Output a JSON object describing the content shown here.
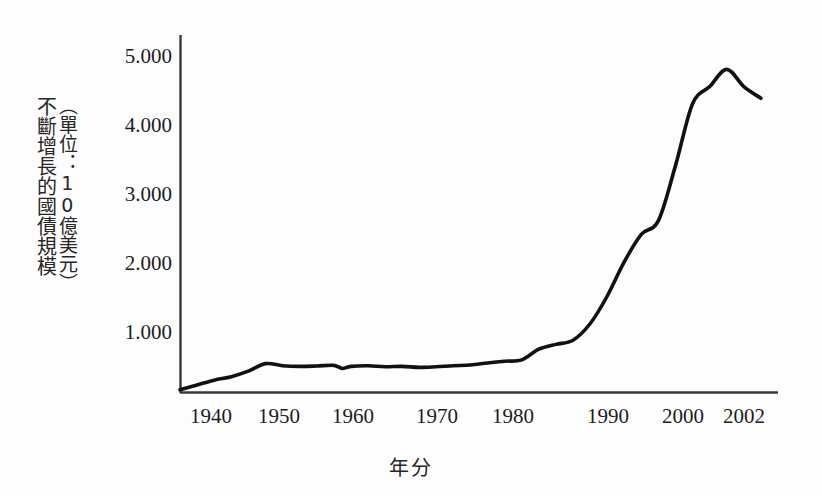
{
  "chart_data": {
    "type": "line",
    "title": "",
    "subtitle": "",
    "xlabel": "年分",
    "ylabel": "不斷增長的國債規模",
    "ylabel_unit": "（單位：10億美元）",
    "xlim": [
      1936,
      2006
    ],
    "ylim": [
      0,
      5400
    ],
    "grid": false,
    "legend": null,
    "xticks": [
      1940,
      1950,
      1960,
      1970,
      1980,
      1990,
      2000,
      2002
    ],
    "xticklabels": [
      "1940",
      "1950",
      "1960",
      "1970",
      "1980",
      "1990",
      "2000",
      "2002"
    ],
    "yticks": [
      1000,
      2000,
      3000,
      4000,
      5000
    ],
    "yticklabels": [
      "1.000",
      "2.000",
      "3.000",
      "4.000",
      "5.000"
    ],
    "series": [
      {
        "name": "國債規模",
        "color": "#111111",
        "x": [
          1936,
          1938,
          1940,
          1942,
          1944,
          1946,
          1948,
          1950,
          1952,
          1954,
          1955,
          1956,
          1958,
          1960,
          1962,
          1964,
          1966,
          1968,
          1970,
          1972,
          1974,
          1976,
          1978,
          1980,
          1982,
          1984,
          1986,
          1988,
          1990,
          1992,
          1994,
          1996,
          1998,
          2000,
          2002,
          2004
        ],
        "values": [
          40,
          110,
          180,
          230,
          310,
          420,
          390,
          380,
          385,
          395,
          350,
          380,
          390,
          375,
          380,
          365,
          375,
          390,
          400,
          430,
          455,
          475,
          630,
          700,
          760,
          1000,
          1400,
          1900,
          2300,
          2500,
          3300,
          4200,
          4450,
          4700,
          4450,
          4280
        ]
      }
    ]
  },
  "axes": {
    "y_axis_name": "y-axis",
    "x_axis_name": "x-axis"
  }
}
